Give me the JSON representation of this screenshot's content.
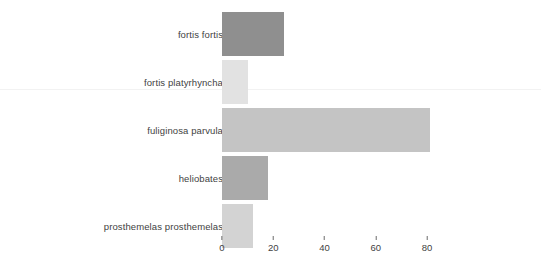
{
  "chart_data": {
    "type": "bar",
    "orientation": "horizontal",
    "title": "",
    "xlabel": "",
    "ylabel": "",
    "categories": [
      "fortis fortis",
      "fortis platyrhyncha",
      "fuliginosa parvula",
      "heliobates",
      "prosthemelas prosthemelas"
    ],
    "values": [
      24,
      10,
      81,
      18,
      12
    ],
    "bar_colors": [
      "#8f8f8f",
      "#e2e2e2",
      "#c4c4c4",
      "#aaaaaa",
      "#d3d3d3"
    ],
    "xlim": [
      0,
      84
    ],
    "xticks": [
      0,
      20,
      40,
      60,
      80
    ],
    "xtick_labels": [
      "0",
      "20",
      "40",
      "60",
      "80"
    ],
    "grid": false,
    "legend": null
  },
  "style": {
    "background": "#ffffff",
    "text_color": "#3f3f3f",
    "tick_color": "#6b6b6b",
    "divider_color": "#f2f2f2"
  },
  "geometry": {
    "plot_left_px": 222,
    "px_per_unit": 2.5625,
    "bar_height_px": 44,
    "bar_pitch_px": 48,
    "first_bar_top_px": 12,
    "divider_top_px": 89
  }
}
